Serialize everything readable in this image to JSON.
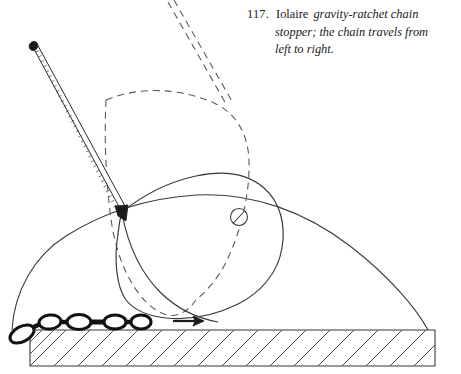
{
  "figure": {
    "number": "117.",
    "subject": "Iolaire",
    "description_line1": "gravity-ratchet   chain",
    "description_line2": "stopper; the chain travels from",
    "description_line3": "left to right.",
    "full_caption": "117. Iolaire gravity-ratchet chain stopper; the chain travels from left to right."
  },
  "colors": {
    "ink": "#1b1b1b",
    "line": "#3a3a3a",
    "dashed": "#5a5a5a",
    "chain": "#111111",
    "paper": "#ffffff"
  },
  "parts": {
    "handle_label": "lever-handle",
    "pawl_label": "gravity-ratchet-pawl",
    "pivot_label": "pivot-pin",
    "base_label": "stopper-base",
    "chain_label": "anchor-chain",
    "deck_label": "deck-section",
    "arrow_label": "chain-travel-direction",
    "ghost_label": "raised-position-outline"
  },
  "annotations": {
    "direction_arrow": "right-arrow",
    "chain_link_count": 5
  }
}
